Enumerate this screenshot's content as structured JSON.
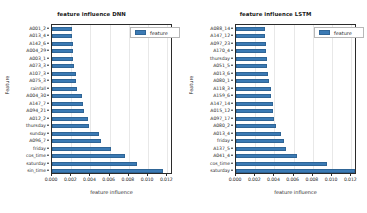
{
  "figure": {
    "background": "#ffffff",
    "bar_color": "#3b7ab4",
    "axis_color": "#2b2b2b",
    "grid_color": "#e8e8e8"
  },
  "panels": [
    {
      "id": "dnn",
      "title": "feature influence DNN",
      "xlabel": "feature influence",
      "ylabel": "Feature",
      "legend_label": "feature",
      "xticks": [
        "0.000",
        "0.002",
        "0.004",
        "0.006",
        "0.008",
        "0.010",
        "0.012"
      ]
    },
    {
      "id": "lstm",
      "title": "feature influence LSTM",
      "xlabel": "feature influence",
      "ylabel": "Feature",
      "legend_label": "feature",
      "xticks": [
        "0.000",
        "0.002",
        "0.004",
        "0.006",
        "0.008",
        "0.010",
        "0.012"
      ]
    }
  ],
  "chart_data": [
    {
      "type": "bar",
      "orientation": "horizontal",
      "title": "feature influence DNN",
      "xlabel": "feature influence",
      "ylabel": "Feature",
      "legend": [
        "feature"
      ],
      "legend_position": "upper right",
      "grid": true,
      "xlim": [
        0.0,
        0.0126
      ],
      "xticks": [
        0.0,
        0.002,
        0.004,
        0.006,
        0.008,
        0.01,
        0.012
      ],
      "categories": [
        "A001_2",
        "A013_4",
        "A142_6",
        "A004_29",
        "A003_1",
        "A073_3",
        "A107_3",
        "A075_3",
        "rainfall",
        "A004_30",
        "A147_7",
        "A094_21",
        "A012_2",
        "thursday",
        "sunday",
        "A096_7",
        "friday",
        "cos_time",
        "saturday",
        "sin_time"
      ],
      "values": [
        0.00208,
        0.00211,
        0.00214,
        0.00216,
        0.0022,
        0.00224,
        0.00248,
        0.00252,
        0.00258,
        0.00312,
        0.00318,
        0.0033,
        0.0038,
        0.00384,
        0.00492,
        0.00508,
        0.0061,
        0.00755,
        0.0088,
        0.01155
      ]
    },
    {
      "type": "bar",
      "orientation": "horizontal",
      "title": "feature influence LSTM",
      "xlabel": "feature influence",
      "ylabel": "Feature",
      "legend": [
        "feature"
      ],
      "legend_position": "upper right",
      "grid": true,
      "xlim": [
        0.0,
        0.0126
      ],
      "xticks": [
        0.0,
        0.002,
        0.004,
        0.006,
        0.008,
        0.01,
        0.012
      ],
      "categories": [
        "A088_14",
        "A147_12",
        "A097_23",
        "A170_4",
        "thursday",
        "A051_5",
        "A013_6",
        "A080_1",
        "A118_3",
        "A159_6",
        "A147_14",
        "A015_12",
        "A097_17",
        "A080_2",
        "A013_4",
        "friday",
        "A137_5",
        "A041_4",
        "cos_time",
        "saturday"
      ],
      "values": [
        0.003,
        0.00302,
        0.00308,
        0.00312,
        0.00322,
        0.00326,
        0.00334,
        0.00346,
        0.00362,
        0.00368,
        0.00384,
        0.0039,
        0.004,
        0.00418,
        0.0047,
        0.005,
        0.00518,
        0.0063,
        0.0095,
        0.01235
      ]
    }
  ]
}
